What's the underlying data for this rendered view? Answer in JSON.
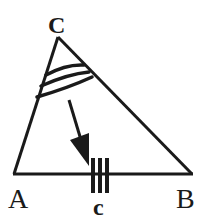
{
  "diagram": {
    "type": "triangle",
    "colors": {
      "stroke": "#1a1a1a",
      "background": "#ffffff"
    },
    "vertices": {
      "C": {
        "label": "C",
        "x": 58,
        "y": 37
      },
      "A": {
        "label": "A",
        "x": 14,
        "y": 174
      },
      "B": {
        "label": "B",
        "x": 192,
        "y": 174
      }
    },
    "side_label": {
      "text": "c",
      "side": "AB"
    },
    "angle_marks": {
      "vertex": "C",
      "arc_count": 3
    },
    "side_marks": {
      "side": "AB",
      "tick_count": 3
    },
    "arrow": {
      "from": "angle C",
      "to": "side c"
    }
  }
}
